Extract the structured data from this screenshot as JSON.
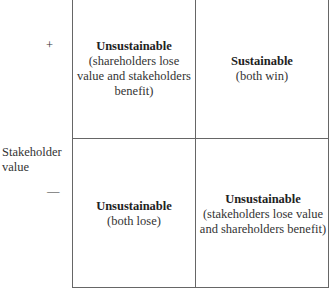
{
  "axis": {
    "y_label_line1": "Stakeholder",
    "y_label_line2": "value",
    "plus": "+",
    "minus": "—"
  },
  "quadrants": {
    "top_left": {
      "title": "Unsustainable",
      "desc": "(shareholders lose value and stakeholders benefit)"
    },
    "top_right": {
      "title": "Sustainable",
      "desc": "(both win)"
    },
    "bottom_left": {
      "title": "Unsustainable",
      "desc": "(both lose)"
    },
    "bottom_right": {
      "title": "Unsustainable",
      "desc": "(stakeholders lose value and shareholders benefit)"
    }
  }
}
